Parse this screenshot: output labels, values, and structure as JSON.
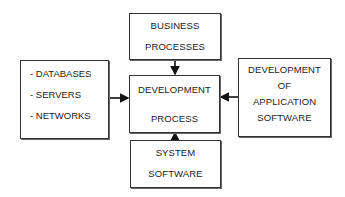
{
  "diagram": {
    "center": {
      "lines": [
        "DEVELOPMENT",
        "PROCESS"
      ]
    },
    "top": {
      "lines": [
        "BUSINESS",
        "PROCESSES"
      ]
    },
    "bottom": {
      "lines": [
        "SYSTEM",
        "SOFTWARE"
      ]
    },
    "left": {
      "lines": [
        "- DATABASES",
        "- SERVERS",
        "- NETWORKS"
      ]
    },
    "right": {
      "lines": [
        "DEVELOPMENT",
        "OF",
        "APPLICATION",
        "SOFTWARE"
      ]
    },
    "arrows": [
      {
        "from": "top",
        "to": "center"
      },
      {
        "from": "bottom",
        "to": "center"
      },
      {
        "from": "left",
        "to": "center"
      },
      {
        "from": "right",
        "to": "center"
      }
    ]
  }
}
